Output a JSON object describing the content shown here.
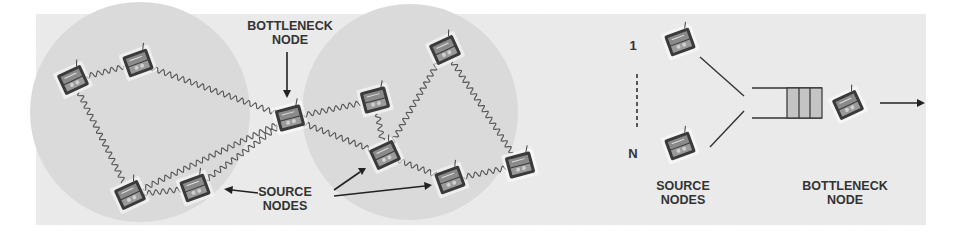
{
  "figure": {
    "left_panel": {
      "title": "Multi-hop wireless network",
      "labels": {
        "bottleneck": [
          "BOTTLENECK",
          "NODE"
        ],
        "source": [
          "SOURCE",
          "NODES"
        ]
      },
      "regions": [
        {
          "id": "left-region",
          "cx": 140,
          "cy": 112,
          "r": 110
        },
        {
          "id": "right-region",
          "cx": 410,
          "cy": 112,
          "r": 108
        }
      ],
      "nodes": [
        {
          "id": "n1",
          "x": 73,
          "y": 80
        },
        {
          "id": "n2",
          "x": 138,
          "y": 63
        },
        {
          "id": "bottleneck",
          "x": 290,
          "y": 118
        },
        {
          "id": "n4",
          "x": 130,
          "y": 195
        },
        {
          "id": "n5",
          "x": 195,
          "y": 188
        },
        {
          "id": "n6",
          "x": 375,
          "y": 100
        },
        {
          "id": "n7",
          "x": 385,
          "y": 155
        },
        {
          "id": "n8",
          "x": 450,
          "y": 180
        },
        {
          "id": "n9",
          "x": 520,
          "y": 165
        },
        {
          "id": "n10",
          "x": 445,
          "y": 50
        }
      ],
      "links": [
        [
          "n1",
          "n2"
        ],
        [
          "n1",
          "n4"
        ],
        [
          "n2",
          "bottleneck"
        ],
        [
          "n4",
          "n5"
        ],
        [
          "n4",
          "bottleneck"
        ],
        [
          "n5",
          "bottleneck"
        ],
        [
          "bottleneck",
          "n6"
        ],
        [
          "bottleneck",
          "n7"
        ],
        [
          "n6",
          "n7"
        ],
        [
          "n7",
          "n10"
        ],
        [
          "n7",
          "n8"
        ],
        [
          "n8",
          "n9"
        ],
        [
          "n10",
          "n9"
        ]
      ]
    },
    "right_panel": {
      "title": "Queue model",
      "source_index_top": "1",
      "source_index_bottom": "N",
      "labels": {
        "source": [
          "SOURCE",
          "NODES"
        ],
        "bottleneck": [
          "BOTTLENECK",
          "NODE"
        ]
      },
      "queue_filled_slots": 3
    },
    "colors": {
      "panel_bg": "#ececec",
      "region_fill": "#dadada",
      "link": "#555555",
      "text": "#333333",
      "queue_fill": "#c4c4c4",
      "laptop_dark": "#3a3a3a",
      "laptop_screen": "#8a8a8a"
    }
  }
}
